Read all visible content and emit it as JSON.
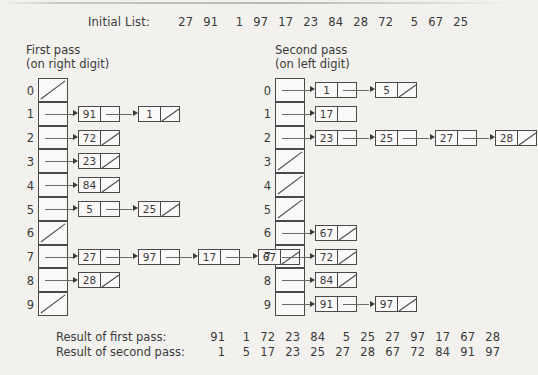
{
  "figure": {
    "initial_label": "Initial List:",
    "initial_list": [
      27,
      91,
      1,
      97,
      17,
      23,
      84,
      28,
      72,
      5,
      67,
      25
    ]
  },
  "first_pass": {
    "heading_line1": "First pass",
    "heading_line2": "(on right digit)",
    "bucket_indices": [
      0,
      1,
      2,
      3,
      4,
      5,
      6,
      7,
      8,
      9
    ],
    "buckets": [
      {
        "index": "0",
        "nodes": []
      },
      {
        "index": "1",
        "nodes": [
          {
            "value": "91",
            "null": false
          },
          {
            "value": "1",
            "null": true
          }
        ]
      },
      {
        "index": "2",
        "nodes": [
          {
            "value": "72",
            "null": true
          }
        ]
      },
      {
        "index": "3",
        "nodes": [
          {
            "value": "23",
            "null": true
          }
        ]
      },
      {
        "index": "4",
        "nodes": [
          {
            "value": "84",
            "null": true
          }
        ]
      },
      {
        "index": "5",
        "nodes": [
          {
            "value": "5",
            "null": false
          },
          {
            "value": "25",
            "null": true
          }
        ]
      },
      {
        "index": "6",
        "nodes": []
      },
      {
        "index": "7",
        "nodes": [
          {
            "value": "27",
            "null": false
          },
          {
            "value": "97",
            "null": false
          },
          {
            "value": "17",
            "null": false
          },
          {
            "value": "67",
            "null": true
          }
        ]
      },
      {
        "index": "8",
        "nodes": [
          {
            "value": "28",
            "null": true
          }
        ]
      },
      {
        "index": "9",
        "nodes": []
      }
    ]
  },
  "second_pass": {
    "heading_line1": "Second pass",
    "heading_line2": "(on left digit)",
    "bucket_indices": [
      0,
      1,
      2,
      3,
      4,
      5,
      6,
      7,
      8,
      9
    ],
    "buckets": [
      {
        "index": "0",
        "nodes": [
          {
            "value": "1",
            "null": false
          },
          {
            "value": "5",
            "null": true
          }
        ]
      },
      {
        "index": "1",
        "nodes": [
          {
            "value": "17",
            "null": false,
            "blank_pointer": true
          }
        ]
      },
      {
        "index": "2",
        "nodes": [
          {
            "value": "23",
            "null": false
          },
          {
            "value": "25",
            "null": false
          },
          {
            "value": "27",
            "null": false
          },
          {
            "value": "28",
            "null": true
          }
        ]
      },
      {
        "index": "3",
        "nodes": []
      },
      {
        "index": "4",
        "nodes": []
      },
      {
        "index": "5",
        "nodes": []
      },
      {
        "index": "6",
        "nodes": [
          {
            "value": "67",
            "null": true
          }
        ]
      },
      {
        "index": "7",
        "nodes": [
          {
            "value": "72",
            "null": true
          }
        ]
      },
      {
        "index": "8",
        "nodes": [
          {
            "value": "84",
            "null": true
          }
        ]
      },
      {
        "index": "9",
        "nodes": [
          {
            "value": "91",
            "null": false
          },
          {
            "value": "97",
            "null": true
          }
        ]
      }
    ]
  },
  "results": {
    "first_label": "Result of first pass:",
    "first_values": [
      91,
      1,
      72,
      23,
      84,
      5,
      25,
      27,
      97,
      17,
      67,
      28
    ],
    "second_label": "Result of second pass:",
    "second_values": [
      1,
      5,
      17,
      23,
      25,
      27,
      28,
      67,
      72,
      84,
      91,
      97
    ]
  },
  "colors": {
    "background": "#f2f1ee",
    "ink": "#3a3a3a",
    "rule": "#4a4a4a",
    "node_fill": "#faf9f7"
  }
}
